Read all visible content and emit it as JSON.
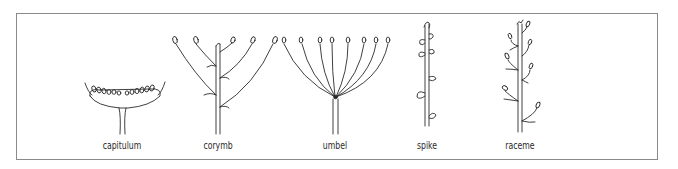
{
  "diagram": {
    "type": "inflorescence types",
    "figures": [
      {
        "id": "capitulum",
        "label": "capitulum"
      },
      {
        "id": "corymb",
        "label": "corymb"
      },
      {
        "id": "umbel",
        "label": "umbel"
      },
      {
        "id": "spike",
        "label": "spike"
      },
      {
        "id": "raceme",
        "label": "raceme"
      }
    ]
  },
  "colors": {
    "stroke": "#2a2a2a",
    "border": "#8a8a8a",
    "background": "#ffffff"
  }
}
